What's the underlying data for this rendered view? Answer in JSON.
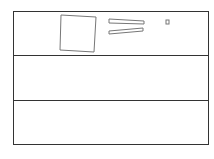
{
  "diagram": {
    "frame": {
      "x": 13,
      "y": 11,
      "width": 196,
      "height": 134,
      "stroke": "#333333"
    },
    "dividers": [
      {
        "y": 55
      },
      {
        "y": 100
      }
    ],
    "shapes": {
      "large_square": {
        "points": "61,15 96,17 94,52 60,50",
        "stroke": "#777777"
      },
      "bar_top": {
        "points": "109,19 144,21 144,24 109,23",
        "stroke": "#777777"
      },
      "bar_bottom": {
        "points": "109,31 143,28 143,31 109,34",
        "stroke": "#777777"
      },
      "small_square": {
        "x": 166,
        "y": 20,
        "width": 3,
        "height": 4,
        "stroke": "#777777"
      }
    }
  }
}
